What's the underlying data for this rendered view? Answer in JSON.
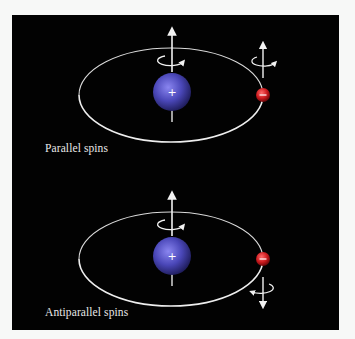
{
  "figure": {
    "background": "#020202",
    "page_background": "#f7f8f7",
    "colors": {
      "nucleus": "#4a47b8",
      "electron": "#cc1a1e",
      "orbit": "#e6e6e6",
      "arrow": "#f2f2f2"
    },
    "panels": [
      {
        "id": "parallel",
        "label": "Parallel spins",
        "nucleus": {
          "charge_symbol": "+",
          "spin": "up"
        },
        "electron": {
          "charge_symbol": "−",
          "spin": "up"
        }
      },
      {
        "id": "antiparallel",
        "label": "Antiparallel spins",
        "nucleus": {
          "charge_symbol": "+",
          "spin": "up"
        },
        "electron": {
          "charge_symbol": "−",
          "spin": "down"
        }
      }
    ]
  }
}
